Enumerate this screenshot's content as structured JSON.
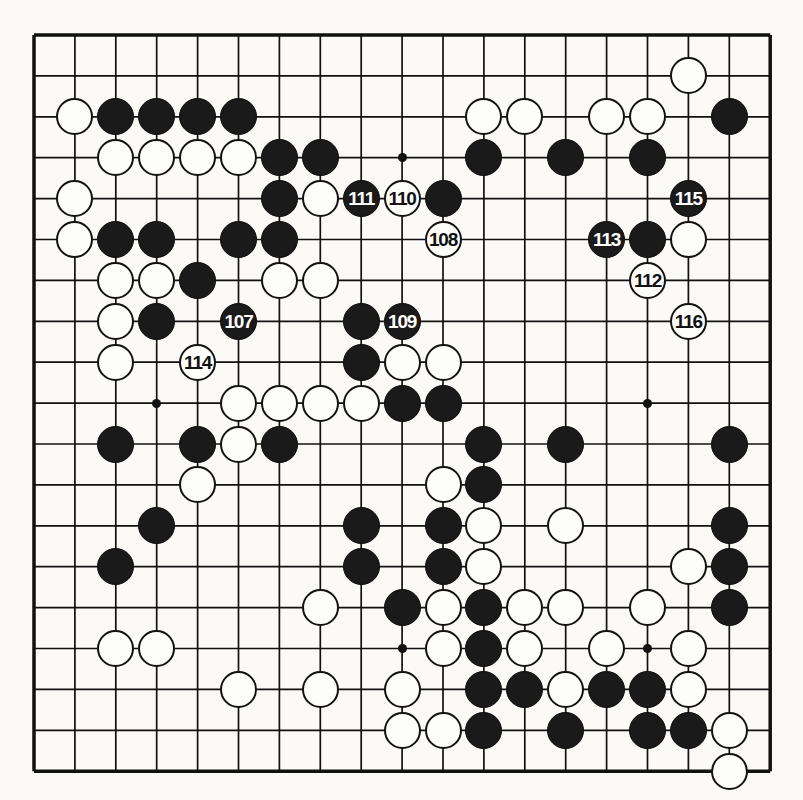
{
  "diagram": {
    "kind": "go-board-diagram",
    "board_size": 19,
    "background_color": "#fbfaf7",
    "line_color": "#111111",
    "black_color": "#1a1a1a",
    "white_color": "#fdfdfb",
    "geometry": {
      "origin_x": 34,
      "origin_y": 35,
      "spacing": 40.9,
      "stone_diameter": 37,
      "border_thickness": 3.5
    },
    "star_points": [
      [
        3,
        3
      ],
      [
        9,
        3
      ],
      [
        15,
        3
      ],
      [
        3,
        9
      ],
      [
        9,
        9
      ],
      [
        15,
        9
      ],
      [
        3,
        15
      ],
      [
        9,
        15
      ],
      [
        15,
        15
      ]
    ],
    "stones": [
      {
        "col": 1,
        "row": 2,
        "color": "white",
        "label": ""
      },
      {
        "col": 2,
        "row": 2,
        "color": "black",
        "label": ""
      },
      {
        "col": 3,
        "row": 2,
        "color": "black",
        "label": ""
      },
      {
        "col": 4,
        "row": 2,
        "color": "black",
        "label": ""
      },
      {
        "col": 5,
        "row": 2,
        "color": "black",
        "label": ""
      },
      {
        "col": 11,
        "row": 2,
        "color": "white",
        "label": ""
      },
      {
        "col": 12,
        "row": 2,
        "color": "white",
        "label": ""
      },
      {
        "col": 14,
        "row": 2,
        "color": "white",
        "label": ""
      },
      {
        "col": 15,
        "row": 2,
        "color": "white",
        "label": ""
      },
      {
        "col": 16,
        "row": 1,
        "color": "white",
        "label": ""
      },
      {
        "col": 17,
        "row": 2,
        "color": "black",
        "label": ""
      },
      {
        "col": 2,
        "row": 3,
        "color": "white",
        "label": ""
      },
      {
        "col": 3,
        "row": 3,
        "color": "white",
        "label": ""
      },
      {
        "col": 4,
        "row": 3,
        "color": "white",
        "label": ""
      },
      {
        "col": 5,
        "row": 3,
        "color": "white",
        "label": ""
      },
      {
        "col": 6,
        "row": 3,
        "color": "black",
        "label": ""
      },
      {
        "col": 7,
        "row": 3,
        "color": "black",
        "label": ""
      },
      {
        "col": 11,
        "row": 3,
        "color": "black",
        "label": ""
      },
      {
        "col": 13,
        "row": 3,
        "color": "black",
        "label": ""
      },
      {
        "col": 15,
        "row": 3,
        "color": "black",
        "label": ""
      },
      {
        "col": 1,
        "row": 4,
        "color": "white",
        "label": ""
      },
      {
        "col": 6,
        "row": 4,
        "color": "black",
        "label": ""
      },
      {
        "col": 7,
        "row": 4,
        "color": "white",
        "label": ""
      },
      {
        "col": 8,
        "row": 4,
        "color": "black",
        "label": "111"
      },
      {
        "col": 9,
        "row": 4,
        "color": "white",
        "label": "110"
      },
      {
        "col": 10,
        "row": 4,
        "color": "black",
        "label": ""
      },
      {
        "col": 16,
        "row": 4,
        "color": "black",
        "label": "115"
      },
      {
        "col": 1,
        "row": 5,
        "color": "white",
        "label": ""
      },
      {
        "col": 2,
        "row": 5,
        "color": "black",
        "label": ""
      },
      {
        "col": 3,
        "row": 5,
        "color": "black",
        "label": ""
      },
      {
        "col": 5,
        "row": 5,
        "color": "black",
        "label": ""
      },
      {
        "col": 6,
        "row": 5,
        "color": "black",
        "label": ""
      },
      {
        "col": 10,
        "row": 5,
        "color": "white",
        "label": "108"
      },
      {
        "col": 14,
        "row": 5,
        "color": "black",
        "label": "113"
      },
      {
        "col": 15,
        "row": 5,
        "color": "black",
        "label": ""
      },
      {
        "col": 16,
        "row": 5,
        "color": "white",
        "label": ""
      },
      {
        "col": 2,
        "row": 6,
        "color": "white",
        "label": ""
      },
      {
        "col": 3,
        "row": 6,
        "color": "white",
        "label": ""
      },
      {
        "col": 4,
        "row": 6,
        "color": "black",
        "label": ""
      },
      {
        "col": 6,
        "row": 6,
        "color": "white",
        "label": ""
      },
      {
        "col": 7,
        "row": 6,
        "color": "white",
        "label": ""
      },
      {
        "col": 15,
        "row": 6,
        "color": "white",
        "label": "112"
      },
      {
        "col": 2,
        "row": 7,
        "color": "white",
        "label": ""
      },
      {
        "col": 3,
        "row": 7,
        "color": "black",
        "label": ""
      },
      {
        "col": 5,
        "row": 7,
        "color": "black",
        "label": "107"
      },
      {
        "col": 8,
        "row": 7,
        "color": "black",
        "label": ""
      },
      {
        "col": 9,
        "row": 7,
        "color": "black",
        "label": "109"
      },
      {
        "col": 16,
        "row": 7,
        "color": "white",
        "label": "116"
      },
      {
        "col": 2,
        "row": 8,
        "color": "white",
        "label": ""
      },
      {
        "col": 4,
        "row": 8,
        "color": "white",
        "label": "114"
      },
      {
        "col": 8,
        "row": 8,
        "color": "black",
        "label": ""
      },
      {
        "col": 9,
        "row": 8,
        "color": "white",
        "label": ""
      },
      {
        "col": 10,
        "row": 8,
        "color": "white",
        "label": ""
      },
      {
        "col": 5,
        "row": 9,
        "color": "white",
        "label": ""
      },
      {
        "col": 6,
        "row": 9,
        "color": "white",
        "label": ""
      },
      {
        "col": 7,
        "row": 9,
        "color": "white",
        "label": ""
      },
      {
        "col": 8,
        "row": 9,
        "color": "white",
        "label": ""
      },
      {
        "col": 9,
        "row": 9,
        "color": "black",
        "label": ""
      },
      {
        "col": 10,
        "row": 9,
        "color": "black",
        "label": ""
      },
      {
        "col": 2,
        "row": 10,
        "color": "black",
        "label": ""
      },
      {
        "col": 4,
        "row": 10,
        "color": "black",
        "label": ""
      },
      {
        "col": 5,
        "row": 10,
        "color": "white",
        "label": ""
      },
      {
        "col": 6,
        "row": 10,
        "color": "black",
        "label": ""
      },
      {
        "col": 11,
        "row": 10,
        "color": "black",
        "label": ""
      },
      {
        "col": 13,
        "row": 10,
        "color": "black",
        "label": ""
      },
      {
        "col": 17,
        "row": 10,
        "color": "black",
        "label": ""
      },
      {
        "col": 4,
        "row": 11,
        "color": "white",
        "label": ""
      },
      {
        "col": 10,
        "row": 11,
        "color": "white",
        "label": ""
      },
      {
        "col": 11,
        "row": 11,
        "color": "black",
        "label": ""
      },
      {
        "col": 3,
        "row": 12,
        "color": "black",
        "label": ""
      },
      {
        "col": 8,
        "row": 12,
        "color": "black",
        "label": ""
      },
      {
        "col": 10,
        "row": 12,
        "color": "black",
        "label": ""
      },
      {
        "col": 11,
        "row": 12,
        "color": "white",
        "label": ""
      },
      {
        "col": 13,
        "row": 12,
        "color": "white",
        "label": ""
      },
      {
        "col": 17,
        "row": 12,
        "color": "black",
        "label": ""
      },
      {
        "col": 2,
        "row": 13,
        "color": "black",
        "label": ""
      },
      {
        "col": 8,
        "row": 13,
        "color": "black",
        "label": ""
      },
      {
        "col": 10,
        "row": 13,
        "color": "black",
        "label": ""
      },
      {
        "col": 11,
        "row": 13,
        "color": "white",
        "label": ""
      },
      {
        "col": 16,
        "row": 13,
        "color": "white",
        "label": ""
      },
      {
        "col": 17,
        "row": 13,
        "color": "black",
        "label": ""
      },
      {
        "col": 7,
        "row": 14,
        "color": "white",
        "label": ""
      },
      {
        "col": 9,
        "row": 14,
        "color": "black",
        "label": ""
      },
      {
        "col": 10,
        "row": 14,
        "color": "white",
        "label": ""
      },
      {
        "col": 11,
        "row": 14,
        "color": "black",
        "label": ""
      },
      {
        "col": 12,
        "row": 14,
        "color": "white",
        "label": ""
      },
      {
        "col": 13,
        "row": 14,
        "color": "white",
        "label": ""
      },
      {
        "col": 15,
        "row": 14,
        "color": "white",
        "label": ""
      },
      {
        "col": 17,
        "row": 14,
        "color": "black",
        "label": ""
      },
      {
        "col": 2,
        "row": 15,
        "color": "white",
        "label": ""
      },
      {
        "col": 3,
        "row": 15,
        "color": "white",
        "label": ""
      },
      {
        "col": 10,
        "row": 15,
        "color": "white",
        "label": ""
      },
      {
        "col": 11,
        "row": 15,
        "color": "black",
        "label": ""
      },
      {
        "col": 12,
        "row": 15,
        "color": "white",
        "label": ""
      },
      {
        "col": 14,
        "row": 15,
        "color": "white",
        "label": ""
      },
      {
        "col": 16,
        "row": 15,
        "color": "white",
        "label": ""
      },
      {
        "col": 5,
        "row": 16,
        "color": "white",
        "label": ""
      },
      {
        "col": 7,
        "row": 16,
        "color": "white",
        "label": ""
      },
      {
        "col": 9,
        "row": 16,
        "color": "white",
        "label": ""
      },
      {
        "col": 11,
        "row": 16,
        "color": "black",
        "label": ""
      },
      {
        "col": 12,
        "row": 16,
        "color": "black",
        "label": ""
      },
      {
        "col": 13,
        "row": 16,
        "color": "white",
        "label": ""
      },
      {
        "col": 14,
        "row": 16,
        "color": "black",
        "label": ""
      },
      {
        "col": 15,
        "row": 16,
        "color": "black",
        "label": ""
      },
      {
        "col": 16,
        "row": 16,
        "color": "white",
        "label": ""
      },
      {
        "col": 9,
        "row": 17,
        "color": "white",
        "label": ""
      },
      {
        "col": 10,
        "row": 17,
        "color": "white",
        "label": ""
      },
      {
        "col": 11,
        "row": 17,
        "color": "black",
        "label": ""
      },
      {
        "col": 13,
        "row": 17,
        "color": "black",
        "label": ""
      },
      {
        "col": 15,
        "row": 17,
        "color": "black",
        "label": ""
      },
      {
        "col": 16,
        "row": 17,
        "color": "black",
        "label": ""
      },
      {
        "col": 17,
        "row": 17,
        "color": "white",
        "label": ""
      },
      {
        "col": 17,
        "row": 18,
        "color": "white",
        "label": ""
      }
    ],
    "move_labels": [
      "107",
      "108",
      "109",
      "110",
      "111",
      "112",
      "113",
      "114",
      "115",
      "116"
    ]
  }
}
